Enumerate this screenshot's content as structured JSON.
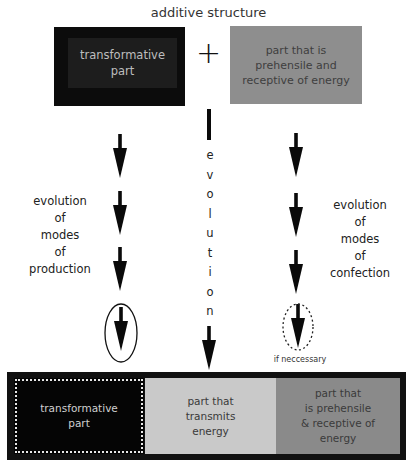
{
  "title": "additive structure",
  "top": {
    "left_box": {
      "label": "transformative part",
      "line1": "transformative",
      "line2": "part"
    },
    "operator": "+",
    "right_box": {
      "label": "part that is prehensile and receptive of energy",
      "line1": "part that is",
      "line2": "prehensile and",
      "line3": "receptive of energy"
    }
  },
  "left_column": {
    "label_lines": [
      "evolution",
      "of",
      "modes",
      "of",
      "production"
    ],
    "arrow_count": 4,
    "last_arrow_enclosure": "solid-ellipse"
  },
  "center_column": {
    "letters": [
      "e",
      "v",
      "o",
      "l",
      "u",
      "t",
      "i",
      "o",
      "n"
    ],
    "word": "evolution"
  },
  "right_column": {
    "label_lines": [
      "evolution",
      "of",
      "modes",
      "of",
      "confection"
    ],
    "arrow_count": 4,
    "last_arrow_enclosure": "dashed-ellipse",
    "note": "if neccessary"
  },
  "bottom": {
    "cells": [
      {
        "lines": [
          "transformative",
          "part"
        ]
      },
      {
        "lines": [
          "part that",
          "transmits",
          "energy"
        ]
      },
      {
        "lines": [
          "part that",
          "is prehensile",
          "& receptive of",
          "energy"
        ]
      }
    ]
  },
  "colors": {
    "black_box": "#0c0c0c",
    "gray_box": "#8e8e8e",
    "light_gray_cell": "#c9c9c9",
    "mid_gray_cell": "#8a8a8a"
  }
}
